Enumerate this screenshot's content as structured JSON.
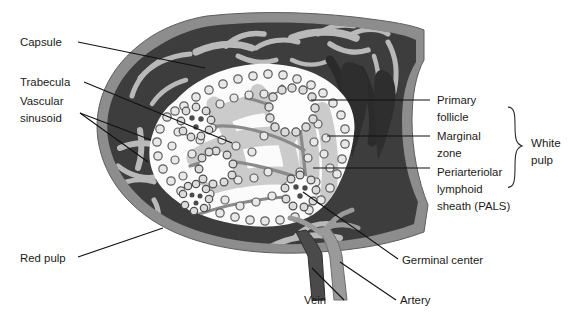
{
  "figure": {
    "background_color": "#ffffff"
  },
  "palette": {
    "capsule": "#8d8d8d",
    "capsule_edge": "#6f6f6f",
    "red_pulp": "#3d3d3d",
    "trabecula": "#b9b9b9",
    "white_pulp_fill": "#fbfbfb",
    "pals_fill": "#cfcfcf",
    "marginal_cell": "#6a6a6a",
    "vein": "#4a4a4a",
    "artery": "#9a9a9a",
    "follicle_center": "#f6f6f6",
    "line": "#111111",
    "text": "#1a1a1a"
  },
  "labels": {
    "left": [
      {
        "id": "capsule",
        "text": "Capsule",
        "x": 20,
        "y": 46
      },
      {
        "id": "trabecula",
        "text": "Trabecula",
        "x": 20,
        "y": 86
      },
      {
        "id": "vascular-sinusoid",
        "text": "Vascular",
        "x": 20,
        "y": 105
      },
      {
        "id": "vascular-sinusoid-2",
        "text": "sinusoid",
        "x": 20,
        "y": 122
      },
      {
        "id": "red-pulp",
        "text": "Red pulp",
        "x": 20,
        "y": 262
      }
    ],
    "right": [
      {
        "id": "primary-follicle",
        "text": "Primary",
        "x": 437,
        "y": 104
      },
      {
        "id": "primary-follicle-2",
        "text": "follicle",
        "x": 437,
        "y": 121
      },
      {
        "id": "marginal-zone",
        "text": "Marginal",
        "x": 437,
        "y": 140
      },
      {
        "id": "marginal-zone-2",
        "text": "zone",
        "x": 437,
        "y": 157
      },
      {
        "id": "pals",
        "text": "Periarteriolar",
        "x": 437,
        "y": 176
      },
      {
        "id": "pals-2",
        "text": "lymphoid",
        "x": 437,
        "y": 193
      },
      {
        "id": "pals-3",
        "text": "sheath (PALS)",
        "x": 437,
        "y": 210
      }
    ],
    "bracket": [
      {
        "id": "white-pulp",
        "text": "White",
        "x": 531,
        "y": 147
      },
      {
        "id": "white-pulp-2",
        "text": "pulp",
        "x": 531,
        "y": 164
      }
    ],
    "bottom": [
      {
        "id": "germinal-center",
        "text": "Germinal center",
        "x": 402,
        "y": 264
      },
      {
        "id": "vein",
        "text": "Vein",
        "x": 304,
        "y": 304
      },
      {
        "id": "artery",
        "text": "Artery",
        "x": 400,
        "y": 304
      }
    ]
  },
  "structures": [
    {
      "id": "capsule",
      "name": "Capsule",
      "kind": "outer-band"
    },
    {
      "id": "trabecula",
      "name": "Trabecula",
      "kind": "branching-strand"
    },
    {
      "id": "vascular-sinusoid",
      "name": "Vascular sinusoid",
      "kind": "channel"
    },
    {
      "id": "red-pulp",
      "name": "Red pulp",
      "kind": "region"
    },
    {
      "id": "white-pulp",
      "name": "White pulp",
      "kind": "region"
    },
    {
      "id": "primary-follicle",
      "name": "Primary follicle",
      "kind": "nodule"
    },
    {
      "id": "marginal-zone",
      "name": "Marginal zone",
      "kind": "cell-ring"
    },
    {
      "id": "pals",
      "name": "Periarteriolar lymphoid sheath (PALS)",
      "kind": "sheath"
    },
    {
      "id": "germinal-center",
      "name": "Germinal center",
      "kind": "nodule-core"
    },
    {
      "id": "vein",
      "name": "Vein",
      "kind": "vessel"
    },
    {
      "id": "artery",
      "name": "Artery",
      "kind": "vessel"
    }
  ]
}
